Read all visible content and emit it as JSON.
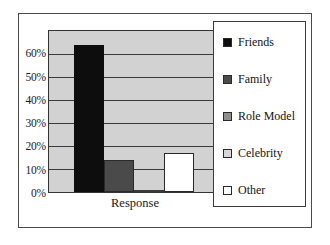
{
  "chart_data": {
    "type": "bar",
    "title": "",
    "subtitle": "",
    "xlabel": "Response",
    "ylabel": "",
    "categories": [
      "Friends",
      "Family",
      "Role Model",
      "Celebrity",
      "Other"
    ],
    "values": [
      64,
      14,
      1,
      0,
      17
    ],
    "value_labels": [
      "64%",
      "14%",
      "1%",
      "0%",
      "17%"
    ],
    "ylim": [
      0,
      70
    ],
    "y_ticks": [
      0,
      10,
      20,
      30,
      40,
      50,
      60
    ],
    "y_tick_labels": [
      "0%",
      "10%",
      "20%",
      "30%",
      "40%",
      "50%",
      "60%"
    ],
    "x_tick_labels": [
      "Response"
    ],
    "grid": "horizontal",
    "legend_position": "right",
    "legend": [
      {
        "label": "Friends",
        "color": "#0d0d0d"
      },
      {
        "label": "Family",
        "color": "#4a4a4a"
      },
      {
        "label": "Role Model",
        "color": "#8f8f8f"
      },
      {
        "label": "Celebrity",
        "color": "#d8d8d8"
      },
      {
        "label": "Other",
        "color": "#ffffff"
      }
    ],
    "series": [
      {
        "name": "Response",
        "values": [
          64,
          14,
          1,
          0,
          17
        ]
      }
    ],
    "colors": {
      "friends": "#0d0d0d",
      "family": "#4a4a4a",
      "role_model": "#8f8f8f",
      "celebrity": "#d8d8d8",
      "other": "#ffffff",
      "plot_background": "#d2d2d2",
      "gridline": "#3a3a3a",
      "frame_border": "#4a4a4a",
      "text": "#1a1a1a"
    }
  },
  "axis": {
    "y_labels": [
      "60%",
      "50%",
      "40%",
      "30%",
      "20%",
      "10%",
      "0%"
    ],
    "x_label": "Response"
  },
  "legend": {
    "items": [
      {
        "label": "Friends"
      },
      {
        "label": "Family"
      },
      {
        "label": "Role Model"
      },
      {
        "label": "Celebrity"
      },
      {
        "label": "Other"
      }
    ]
  }
}
